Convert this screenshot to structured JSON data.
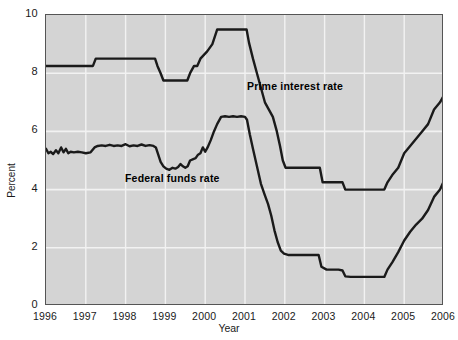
{
  "chart_data": {
    "type": "line",
    "title": "",
    "xlabel": "Year",
    "ylabel": "Percent",
    "xlim": [
      1996,
      2006
    ],
    "ylim": [
      0,
      10
    ],
    "grid": true,
    "legend_position": "inline-annotations",
    "xticks": [
      "1996",
      "1997",
      "1998",
      "1999",
      "2000",
      "2001",
      "2002",
      "2003",
      "2004",
      "2005",
      "2006"
    ],
    "yticks": [
      "0",
      "2",
      "4",
      "6",
      "8",
      "10"
    ],
    "background_color": "#d4d4d4",
    "gridline_color": "#f2f2f2",
    "line_color": "#1a1a1a",
    "series": [
      {
        "name": "Prime interest rate",
        "annotation": "Prime interest rate",
        "points": [
          [
            1996.0,
            8.25
          ],
          [
            1996.2,
            8.25
          ],
          [
            1996.4,
            8.25
          ],
          [
            1996.6,
            8.25
          ],
          [
            1996.8,
            8.25
          ],
          [
            1997.0,
            8.25
          ],
          [
            1997.18,
            8.25
          ],
          [
            1997.25,
            8.5
          ],
          [
            1997.5,
            8.5
          ],
          [
            1997.8,
            8.5
          ],
          [
            1998.0,
            8.5
          ],
          [
            1998.3,
            8.5
          ],
          [
            1998.6,
            8.5
          ],
          [
            1998.74,
            8.5
          ],
          [
            1998.8,
            8.25
          ],
          [
            1998.88,
            8.0
          ],
          [
            1998.95,
            7.75
          ],
          [
            1999.1,
            7.75
          ],
          [
            1999.3,
            7.75
          ],
          [
            1999.5,
            7.75
          ],
          [
            1999.55,
            7.75
          ],
          [
            1999.62,
            8.0
          ],
          [
            1999.72,
            8.25
          ],
          [
            1999.8,
            8.25
          ],
          [
            1999.88,
            8.5
          ],
          [
            2000.05,
            8.75
          ],
          [
            2000.18,
            9.0
          ],
          [
            2000.3,
            9.5
          ],
          [
            2000.42,
            9.5
          ],
          [
            2000.6,
            9.5
          ],
          [
            2000.8,
            9.5
          ],
          [
            2001.0,
            9.5
          ],
          [
            2001.04,
            9.5
          ],
          [
            2001.1,
            9.05
          ],
          [
            2001.2,
            8.5
          ],
          [
            2001.3,
            8.0
          ],
          [
            2001.4,
            7.5
          ],
          [
            2001.5,
            7.0
          ],
          [
            2001.6,
            6.75
          ],
          [
            2001.7,
            6.5
          ],
          [
            2001.8,
            6.0
          ],
          [
            2001.88,
            5.5
          ],
          [
            2001.95,
            5.0
          ],
          [
            2002.02,
            4.75
          ],
          [
            2002.2,
            4.75
          ],
          [
            2002.4,
            4.75
          ],
          [
            2002.6,
            4.75
          ],
          [
            2002.8,
            4.75
          ],
          [
            2002.88,
            4.75
          ],
          [
            2002.95,
            4.25
          ],
          [
            2003.1,
            4.25
          ],
          [
            2003.3,
            4.25
          ],
          [
            2003.45,
            4.25
          ],
          [
            2003.52,
            4.0
          ],
          [
            2003.7,
            4.0
          ],
          [
            2004.0,
            4.0
          ],
          [
            2004.2,
            4.0
          ],
          [
            2004.4,
            4.0
          ],
          [
            2004.5,
            4.0
          ],
          [
            2004.58,
            4.25
          ],
          [
            2004.7,
            4.5
          ],
          [
            2004.85,
            4.75
          ],
          [
            2005.0,
            5.25
          ],
          [
            2005.15,
            5.5
          ],
          [
            2005.3,
            5.75
          ],
          [
            2005.45,
            6.0
          ],
          [
            2005.6,
            6.25
          ],
          [
            2005.75,
            6.75
          ],
          [
            2005.9,
            7.0
          ],
          [
            2006.0,
            7.25
          ]
        ]
      },
      {
        "name": "Federal funds rate",
        "annotation": "Federal funds rate",
        "points": [
          [
            1996.0,
            5.4
          ],
          [
            1996.06,
            5.25
          ],
          [
            1996.12,
            5.3
          ],
          [
            1996.18,
            5.22
          ],
          [
            1996.25,
            5.35
          ],
          [
            1996.31,
            5.25
          ],
          [
            1996.38,
            5.45
          ],
          [
            1996.44,
            5.28
          ],
          [
            1996.5,
            5.4
          ],
          [
            1996.56,
            5.25
          ],
          [
            1996.62,
            5.3
          ],
          [
            1996.7,
            5.28
          ],
          [
            1996.8,
            5.3
          ],
          [
            1996.9,
            5.28
          ],
          [
            1997.0,
            5.25
          ],
          [
            1997.12,
            5.28
          ],
          [
            1997.22,
            5.45
          ],
          [
            1997.3,
            5.5
          ],
          [
            1997.4,
            5.52
          ],
          [
            1997.5,
            5.5
          ],
          [
            1997.6,
            5.54
          ],
          [
            1997.7,
            5.5
          ],
          [
            1997.8,
            5.52
          ],
          [
            1997.9,
            5.5
          ],
          [
            1998.0,
            5.56
          ],
          [
            1998.1,
            5.49
          ],
          [
            1998.2,
            5.52
          ],
          [
            1998.3,
            5.5
          ],
          [
            1998.4,
            5.55
          ],
          [
            1998.5,
            5.5
          ],
          [
            1998.6,
            5.53
          ],
          [
            1998.7,
            5.5
          ],
          [
            1998.76,
            5.45
          ],
          [
            1998.82,
            5.2
          ],
          [
            1998.88,
            4.95
          ],
          [
            1998.95,
            4.8
          ],
          [
            1999.02,
            4.72
          ],
          [
            1999.1,
            4.68
          ],
          [
            1999.18,
            4.75
          ],
          [
            1999.25,
            4.72
          ],
          [
            1999.32,
            4.78
          ],
          [
            1999.38,
            4.88
          ],
          [
            1999.44,
            4.8
          ],
          [
            1999.5,
            4.75
          ],
          [
            1999.56,
            4.8
          ],
          [
            1999.62,
            5.0
          ],
          [
            1999.7,
            5.05
          ],
          [
            1999.76,
            5.08
          ],
          [
            1999.82,
            5.2
          ],
          [
            1999.88,
            5.25
          ],
          [
            1999.94,
            5.45
          ],
          [
            2000.0,
            5.3
          ],
          [
            2000.06,
            5.45
          ],
          [
            2000.14,
            5.7
          ],
          [
            2000.22,
            6.0
          ],
          [
            2000.3,
            6.25
          ],
          [
            2000.4,
            6.5
          ],
          [
            2000.5,
            6.52
          ],
          [
            2000.6,
            6.5
          ],
          [
            2000.7,
            6.52
          ],
          [
            2000.8,
            6.5
          ],
          [
            2000.9,
            6.52
          ],
          [
            2001.0,
            6.5
          ],
          [
            2001.05,
            6.4
          ],
          [
            2001.12,
            5.9
          ],
          [
            2001.2,
            5.4
          ],
          [
            2001.3,
            4.8
          ],
          [
            2001.4,
            4.2
          ],
          [
            2001.5,
            3.8
          ],
          [
            2001.58,
            3.5
          ],
          [
            2001.66,
            3.1
          ],
          [
            2001.74,
            2.6
          ],
          [
            2001.82,
            2.2
          ],
          [
            2001.9,
            1.9
          ],
          [
            2001.98,
            1.8
          ],
          [
            2002.1,
            1.75
          ],
          [
            2002.3,
            1.75
          ],
          [
            2002.5,
            1.75
          ],
          [
            2002.7,
            1.75
          ],
          [
            2002.85,
            1.75
          ],
          [
            2002.92,
            1.35
          ],
          [
            2003.05,
            1.25
          ],
          [
            2003.2,
            1.25
          ],
          [
            2003.35,
            1.25
          ],
          [
            2003.45,
            1.22
          ],
          [
            2003.52,
            1.02
          ],
          [
            2003.65,
            1.0
          ],
          [
            2003.8,
            1.0
          ],
          [
            2004.0,
            1.0
          ],
          [
            2004.2,
            1.0
          ],
          [
            2004.4,
            1.0
          ],
          [
            2004.5,
            1.0
          ],
          [
            2004.58,
            1.25
          ],
          [
            2004.7,
            1.5
          ],
          [
            2004.85,
            1.85
          ],
          [
            2005.0,
            2.25
          ],
          [
            2005.15,
            2.55
          ],
          [
            2005.3,
            2.8
          ],
          [
            2005.45,
            3.0
          ],
          [
            2005.6,
            3.3
          ],
          [
            2005.75,
            3.75
          ],
          [
            2005.9,
            4.0
          ],
          [
            2006.0,
            4.3
          ]
        ]
      }
    ]
  }
}
